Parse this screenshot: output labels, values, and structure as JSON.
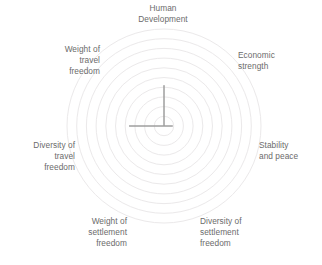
{
  "chart_data": {
    "type": "radar",
    "title": "",
    "categories": [
      "Human Development",
      "Economic strength",
      "Stability and peace",
      "Diversity of settlement freedom",
      "Weight of settlement freedom",
      "Diversity of travel freedom",
      "Weight of travel freedom"
    ],
    "axes": [
      {
        "label": "Human Development",
        "label_lines": "Human\nDevelopment",
        "angle_deg": 0,
        "value": 0.42
      },
      {
        "label": "Economic strength",
        "label_lines": "Economic\nstrength",
        "angle_deg": 45,
        "value": 0.0
      },
      {
        "label": "Stability and peace",
        "label_lines": "Stability\nand peace",
        "angle_deg": 90,
        "value": 0.09
      },
      {
        "label": "Diversity of settlement freedom",
        "label_lines": "Diversity of\nsettlement\nfreedom",
        "angle_deg": 135,
        "value": 0.0
      },
      {
        "label": "Weight of settlement freedom",
        "label_lines": "Weight of\nsettlement\nfreedom",
        "angle_deg": 225,
        "value": 0.0
      },
      {
        "label": "Diversity of travel freedom",
        "label_lines": "Diversity of\ntravel\nfreedom",
        "angle_deg": 270,
        "value": 0.36
      },
      {
        "label": "Weight of travel freedom",
        "label_lines": "Weight of\ntravel\nfreedom",
        "angle_deg": 315,
        "value": 0.0
      }
    ],
    "series": [
      {
        "name": "",
        "values": [
          0.42,
          0.0,
          0.09,
          0.0,
          0.0,
          0.36,
          0.0
        ]
      }
    ],
    "rings": 10,
    "range": [
      0,
      1
    ],
    "grid": true,
    "grid_shape": "circular",
    "legend": "none",
    "xlabel": "",
    "ylabel": "",
    "tick_labels": [],
    "colors": {
      "fill": "#9e9e9e",
      "stroke": "#9e9e9e",
      "grid": "#ebe9ea",
      "label_text": "#6b6b6b",
      "background": "#ffffff"
    }
  },
  "labels": {
    "top": "Human\nDevelopment",
    "top_right": "Economic\nstrength",
    "right": "Stability\nand peace",
    "bottom_right": "Diversity of\nsettlement\nfreedom",
    "bottom_left": "Weight of\nsettlement\nfreedom",
    "left": "Diversity of\ntravel\nfreedom",
    "top_left": "Weight of\ntravel\nfreedom"
  }
}
